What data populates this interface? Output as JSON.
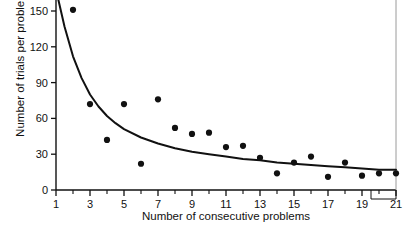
{
  "chart_data": {
    "type": "scatter",
    "title": "",
    "xlabel": "Number of consecutive problems",
    "ylabel": "Number of trials per problem",
    "xlim": [
      1,
      21
    ],
    "ylim": [
      0,
      163
    ],
    "grid": false,
    "legend": null,
    "xticks": [
      1,
      3,
      5,
      7,
      9,
      11,
      13,
      15,
      17,
      19,
      21
    ],
    "xtick_labels": [
      "1",
      "3",
      "5",
      "7",
      "9",
      "11",
      "13",
      "15",
      "17",
      "19",
      "21"
    ],
    "xminor_ticks": [
      2,
      4,
      6,
      8,
      10,
      12,
      14,
      16,
      18,
      20
    ],
    "yticks": [
      0,
      30,
      60,
      90,
      120,
      150
    ],
    "ytick_labels": [
      "0",
      "30",
      "60",
      "90",
      "120",
      "150"
    ],
    "x": [
      1,
      2,
      3,
      4,
      5,
      6,
      7,
      8,
      9,
      10,
      11,
      12,
      13,
      14,
      15,
      16,
      17,
      18,
      19,
      20,
      21
    ],
    "values": [
      163,
      151,
      72,
      42,
      72,
      22,
      76,
      52,
      47,
      48,
      36,
      37,
      27,
      14,
      23,
      28,
      11,
      23,
      12,
      14,
      14
    ],
    "series": [
      {
        "name": "trials per problem",
        "marker": "filled-circle",
        "color": "#111111",
        "values": [
          163,
          151,
          72,
          42,
          72,
          22,
          76,
          52,
          47,
          48,
          36,
          37,
          27,
          14,
          23,
          28,
          11,
          23,
          12,
          14,
          14
        ]
      },
      {
        "name": "fitted decay curve",
        "marker": "none",
        "style": "solid-line",
        "color": "#111111",
        "x": [
          1,
          1.5,
          2,
          2.5,
          3,
          3.5,
          4,
          4.5,
          5,
          6,
          7,
          8,
          9,
          10,
          11,
          12,
          13,
          14,
          15,
          16,
          17,
          18,
          19,
          20,
          21
        ],
        "values": [
          168,
          137,
          112,
          94,
          80,
          70,
          62,
          56,
          51,
          44,
          39,
          35,
          32,
          30,
          28,
          26,
          25,
          23,
          22,
          21,
          20,
          19,
          18,
          17,
          17
        ]
      }
    ]
  }
}
